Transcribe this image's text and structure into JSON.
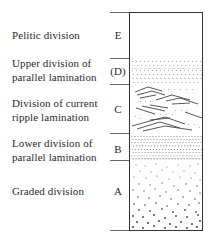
{
  "colors": {
    "line": "#333333",
    "text": "#2a2a2a",
    "dots": "#555555",
    "background": "#ffffff"
  },
  "divisions": [
    {
      "letter": "E",
      "label_lines": [
        "Pelitic division"
      ],
      "pattern": "blank"
    },
    {
      "letter": "(D)",
      "label_lines": [
        "Upper division of",
        "parallel lamination"
      ],
      "pattern": "fine-parallel-dots"
    },
    {
      "letter": "C",
      "label_lines": [
        "Division of current",
        "ripple lamination"
      ],
      "pattern": "ripple-cross-lamination"
    },
    {
      "letter": "B",
      "label_lines": [
        "Lower division of",
        "parallel lamination"
      ],
      "pattern": "parallel-dots"
    },
    {
      "letter": "A",
      "label_lines": [
        "Graded division"
      ],
      "pattern": "graded-dots"
    }
  ]
}
